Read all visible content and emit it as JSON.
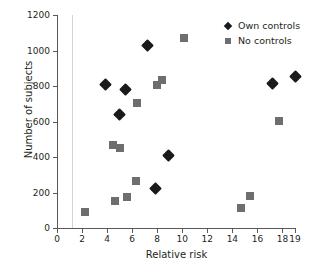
{
  "chart_data": {
    "type": "scatter",
    "title": "",
    "xlabel": "Relative risk",
    "ylabel": "Number of subjects",
    "xlim": [
      0,
      19
    ],
    "ylim": [
      0,
      1200
    ],
    "grid": false,
    "legend_position": "top-right",
    "xticks": [
      0,
      2,
      4,
      6,
      8,
      10,
      12,
      14,
      16,
      18,
      19
    ],
    "xtick_labels": [
      "0",
      "2",
      "4",
      "6",
      "8",
      "10",
      "12",
      "14",
      "16",
      "18",
      "19"
    ],
    "yticks": [
      0,
      200,
      400,
      600,
      800,
      1000,
      1200
    ],
    "ytick_labels": [
      "0",
      "200",
      "400",
      "600",
      "800",
      "1000",
      "1200"
    ],
    "annotations": [
      {
        "name": "reference-line",
        "type": "vline",
        "x": 1.2,
        "color": "#d3d3d5"
      }
    ],
    "series": [
      {
        "name": "Own controls",
        "marker": "diamond",
        "color": "#1a1a1a",
        "points": [
          {
            "x": 3.9,
            "y": 808
          },
          {
            "x": 5.0,
            "y": 640
          },
          {
            "x": 5.5,
            "y": 778
          },
          {
            "x": 7.2,
            "y": 1028
          },
          {
            "x": 7.9,
            "y": 222
          },
          {
            "x": 8.9,
            "y": 408
          },
          {
            "x": 17.2,
            "y": 812
          },
          {
            "x": 19.0,
            "y": 855
          }
        ]
      },
      {
        "name": "No controls",
        "marker": "square",
        "color": "#6d6e70",
        "points": [
          {
            "x": 2.2,
            "y": 90
          },
          {
            "x": 4.5,
            "y": 470
          },
          {
            "x": 4.6,
            "y": 150
          },
          {
            "x": 5.0,
            "y": 450
          },
          {
            "x": 5.6,
            "y": 172
          },
          {
            "x": 6.3,
            "y": 262
          },
          {
            "x": 6.4,
            "y": 703
          },
          {
            "x": 8.0,
            "y": 805
          },
          {
            "x": 8.4,
            "y": 835
          },
          {
            "x": 10.1,
            "y": 1073
          },
          {
            "x": 14.7,
            "y": 113
          },
          {
            "x": 15.4,
            "y": 180
          },
          {
            "x": 17.7,
            "y": 605
          }
        ]
      }
    ]
  },
  "legend": {
    "items": [
      {
        "label": "Own controls",
        "marker": "diamond"
      },
      {
        "label": "No controls",
        "marker": "square"
      }
    ]
  }
}
